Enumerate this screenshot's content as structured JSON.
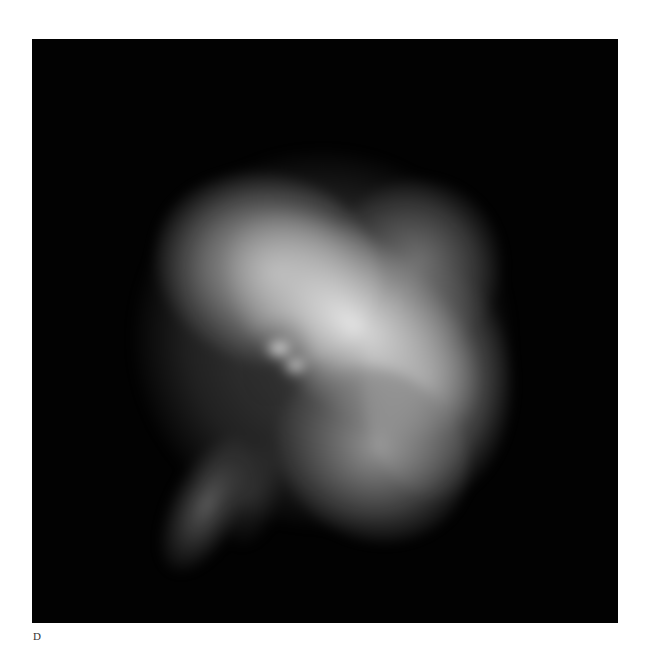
{
  "figure": {
    "panel_label": "D",
    "image_description": "grayscale astronomical image of a nebula (pulsar wind nebula) on black background",
    "colors": {
      "page_background": "#ffffff",
      "image_background": "#020202",
      "label_color": "#333333"
    }
  }
}
